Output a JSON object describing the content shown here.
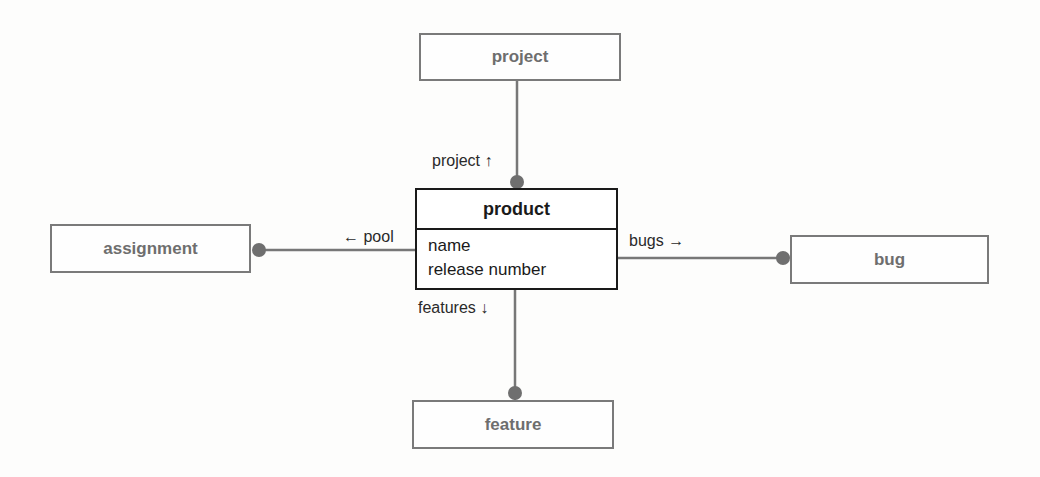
{
  "diagram": {
    "type": "class-association-diagram",
    "central_class": {
      "name": "product",
      "attributes": [
        "name",
        "release number"
      ]
    },
    "related_classes": [
      {
        "id": "project",
        "label": "project"
      },
      {
        "id": "assignment",
        "label": "assignment"
      },
      {
        "id": "bug",
        "label": "bug"
      },
      {
        "id": "feature",
        "label": "feature"
      }
    ],
    "associations": [
      {
        "from": "product",
        "to": "project",
        "role": "project ↑"
      },
      {
        "from": "product",
        "to": "assignment",
        "role": "← pool"
      },
      {
        "from": "product",
        "to": "bug",
        "role": "bugs →"
      },
      {
        "from": "product",
        "to": "feature",
        "role": "features ↓"
      }
    ],
    "colors": {
      "line": "#777777",
      "endpoint_dot": "#6f6f6f",
      "main_border": "#1a1a1a",
      "secondary_border": "#7a7a7a",
      "secondary_text": "#6e6e6e"
    }
  }
}
